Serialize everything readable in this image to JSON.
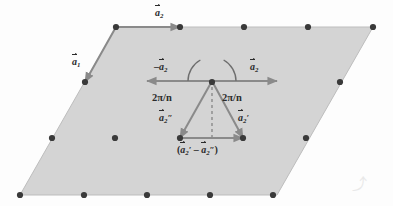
{
  "figure": {
    "type": "lattice-vector-diagram",
    "title_text": "",
    "background_color": "#fdfdfd",
    "parallelogram": {
      "fill_color": "#d4d4d4",
      "stroke_color": "#bdbdbd",
      "corners": [
        {
          "name": "top-left",
          "x": 116,
          "y": 27
        },
        {
          "name": "top-right",
          "x": 373,
          "y": 27
        },
        {
          "name": "bottom-right",
          "x": 277,
          "y": 195
        },
        {
          "name": "bottom-left",
          "x": 20,
          "y": 195
        }
      ]
    },
    "lattice_points": {
      "color": "#3a3a3a",
      "radius": 3.1,
      "rows": [
        {
          "row": "top",
          "y": 27,
          "xs": [
            116,
            180,
            244,
            308,
            373
          ]
        },
        {
          "row": "upper",
          "y": 82,
          "xs": [
            85,
            212,
            340
          ]
        },
        {
          "row": "middle",
          "y": 138,
          "xs": [
            52,
            115,
            180,
            243,
            306
          ]
        },
        {
          "row": "bottom",
          "y": 195,
          "xs": [
            20,
            84,
            147,
            210,
            273
          ]
        }
      ]
    },
    "vectors": {
      "stroke_color": "#8a8a8a",
      "stroke_width": 2,
      "items": [
        {
          "name": "a2-top-edge",
          "x1": 116,
          "y1": 27,
          "x2": 180,
          "y2": 27
        },
        {
          "name": "a1-left-edge",
          "x1": 116,
          "y1": 27,
          "x2": 85,
          "y2": 82
        },
        {
          "name": "minus-a2-left",
          "x1": 212,
          "y1": 81,
          "x2": 147,
          "y2": 81
        },
        {
          "name": "a2-right",
          "x1": 212,
          "y1": 81,
          "x2": 277,
          "y2": 81
        },
        {
          "name": "a2-double-prime",
          "x1": 212,
          "y1": 81,
          "x2": 180,
          "y2": 138
        },
        {
          "name": "a2-prime",
          "x1": 212,
          "y1": 81,
          "x2": 243,
          "y2": 138
        },
        {
          "name": "a2-difference",
          "x1": 180,
          "y1": 138,
          "x2": 243,
          "y2": 138
        }
      ],
      "dashed": {
        "name": "bisector-dashed",
        "x1": 212,
        "y1": 81,
        "x2": 212,
        "y2": 140,
        "dash_pattern": "3,3"
      }
    },
    "angle_arcs": [
      {
        "name": "arc-left",
        "cx": 212,
        "cy": 81,
        "radius": 24,
        "start_deg": 180,
        "end_deg": 241
      },
      {
        "name": "arc-right",
        "cx": 212,
        "cy": 81,
        "radius": 24,
        "start_deg": 299,
        "end_deg": 360
      }
    ],
    "labels": {
      "a2_top": {
        "base": "a",
        "sub": "2",
        "prime": "",
        "minus": false,
        "x": 155,
        "y": 8
      },
      "a1_left": {
        "base": "a",
        "sub": "1",
        "prime": "",
        "minus": false,
        "x": 72,
        "y": 57
      },
      "minus_a2": {
        "base": "a",
        "sub": "2",
        "prime": "",
        "minus": true,
        "x": 154,
        "y": 62
      },
      "a2_right": {
        "base": "a",
        "sub": "2",
        "prime": "",
        "minus": false,
        "x": 250,
        "y": 62
      },
      "a2_double_prime": {
        "base": "a",
        "sub": "2",
        "prime": "″",
        "minus": false,
        "x": 159,
        "y": 113
      },
      "a2_prime": {
        "base": "a",
        "sub": "2",
        "prime": "′",
        "minus": false,
        "x": 238,
        "y": 113
      }
    },
    "angle_text": {
      "left": {
        "text": "2π/n",
        "x": 152,
        "y": 93
      },
      "right": {
        "text": "2π/n",
        "x": 222,
        "y": 93
      }
    },
    "difference_label": {
      "open_paren": "(",
      "first_base": "a",
      "first_sub": "2",
      "first_prime": "′",
      "operator": "–",
      "second_base": "a",
      "second_sub": "2",
      "second_prime": "″",
      "close_paren": ")",
      "x": 177,
      "y": 145
    },
    "watermark": {
      "text": "⤴",
      "x": 352,
      "y": 172
    }
  }
}
